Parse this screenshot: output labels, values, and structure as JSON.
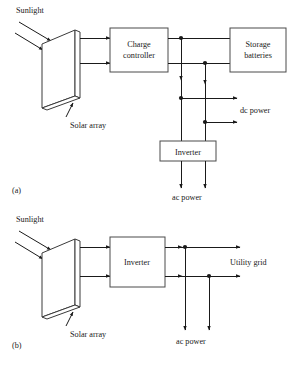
{
  "figure": {
    "type": "diagram",
    "background_color": "#ffffff",
    "line_color": "#1a1a1a",
    "box_stroke_color": "#4a4a4a",
    "partial_caption": "",
    "panels": [
      {
        "id": "a",
        "label": "(a)",
        "description": "Stand-alone solar array with charge controller, storage batteries and inverter",
        "source_label": "Sunlight",
        "array_label": "Solar array",
        "blocks": [
          {
            "name": "charge-controller",
            "line1": "Charge",
            "line2": "controller"
          },
          {
            "name": "storage-batteries",
            "line1": "Storage",
            "line2": "batteries"
          },
          {
            "name": "inverter",
            "line1": "Inverter",
            "line2": ""
          }
        ],
        "outputs": [
          {
            "name": "dc-power",
            "label": "dc power"
          },
          {
            "name": "ac-power",
            "label": "ac power"
          }
        ]
      },
      {
        "id": "b",
        "label": "(b)",
        "description": "Grid-tied solar array feeding an inverter connected to the utility grid",
        "source_label": "Sunlight",
        "array_label": "Solar array",
        "blocks": [
          {
            "name": "inverter",
            "line1": "Inverter",
            "line2": ""
          }
        ],
        "outputs": [
          {
            "name": "utility-grid",
            "label": "Utility grid"
          },
          {
            "name": "ac-power",
            "label": "ac power"
          }
        ]
      }
    ]
  }
}
